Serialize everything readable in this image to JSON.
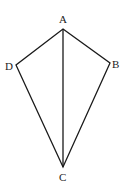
{
  "diagram": {
    "type": "kite",
    "stroke_color": "#1a1a1a",
    "vertices": {
      "A": {
        "label": "A",
        "x": 63,
        "y": 29
      },
      "B": {
        "label": "B",
        "x": 110,
        "y": 63
      },
      "C": {
        "label": "C",
        "x": 63,
        "y": 167
      },
      "D": {
        "label": "D",
        "x": 16,
        "y": 65
      }
    },
    "segments": [
      "AB",
      "BC",
      "CD",
      "DA",
      "AC"
    ]
  }
}
